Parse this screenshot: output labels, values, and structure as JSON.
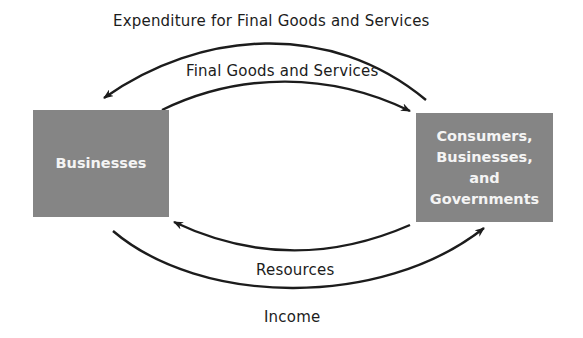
{
  "diagram": {
    "title_top": "Expenditure for Final Goods and Services",
    "label_goods": "Final Goods and Services",
    "label_resources": "Resources",
    "label_income": "Income",
    "nodes": {
      "left": "Businesses",
      "right_lines": [
        "Consumers,",
        "Businesses,",
        "and",
        "Governments"
      ]
    },
    "flows": [
      {
        "label": "Expenditure for Final Goods and Services",
        "from": "Consumers, Businesses, and Governments",
        "to": "Businesses"
      },
      {
        "label": "Final Goods and Services",
        "from": "Businesses",
        "to": "Consumers, Businesses, and Governments"
      },
      {
        "label": "Resources",
        "from": "Consumers, Businesses, and Governments",
        "to": "Businesses"
      },
      {
        "label": "Income",
        "from": "Businesses",
        "to": "Consumers, Businesses, and Governments"
      }
    ],
    "colors": {
      "box": "#858585",
      "box_text": "#f4f4f4",
      "arrow": "#1c1c1c"
    }
  }
}
